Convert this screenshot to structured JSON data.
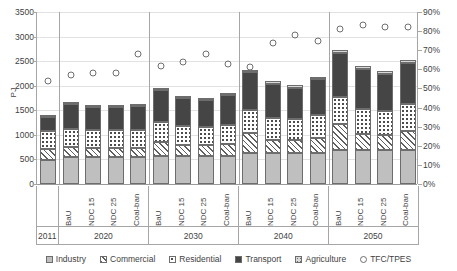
{
  "chart_data": {
    "type": "bar",
    "title": "",
    "xlabel": "",
    "ylabel": "PJ",
    "ylim": [
      0,
      3500
    ],
    "y_ticks": [
      0,
      500,
      1000,
      1500,
      2000,
      2500,
      3000,
      3500
    ],
    "secondary_ylabel": "",
    "secondary_ylim": [
      0,
      90
    ],
    "secondary_y_ticks": [
      "0%",
      "10%",
      "20%",
      "30%",
      "40%",
      "50%",
      "60%",
      "70%",
      "80%",
      "90%"
    ],
    "grid": true,
    "stacked": true,
    "legend_position": "bottom",
    "categories": [
      "2011",
      "BaU",
      "NDC 15",
      "NDC 25",
      "Coal-ban",
      "BaU",
      "NDC 15",
      "NDC 25",
      "Coal-ban",
      "BaU",
      "NDC 15",
      "NDC 25",
      "Coal-ban",
      "BaU",
      "NDC 15",
      "NDC 25",
      "Coal-ban"
    ],
    "groups": [
      {
        "label": "2011",
        "count": 1
      },
      {
        "label": "2020",
        "count": 4
      },
      {
        "label": "2030",
        "count": 4
      },
      {
        "label": "2040",
        "count": 4
      },
      {
        "label": "2050",
        "count": 4
      }
    ],
    "series": [
      {
        "name": "Industry",
        "values": [
          490,
          545,
          545,
          545,
          545,
          580,
          580,
          580,
          580,
          640,
          640,
          640,
          640,
          690,
          690,
          690,
          690
        ]
      },
      {
        "name": "Commercial",
        "values": [
          225,
          200,
          195,
          195,
          190,
          280,
          210,
          205,
          230,
          390,
          265,
          255,
          300,
          530,
          330,
          315,
          390
        ]
      },
      {
        "name": "Residential",
        "values": [
          355,
          370,
          365,
          360,
          370,
          410,
          390,
          375,
          400,
          480,
          440,
          420,
          460,
          560,
          510,
          480,
          540
        ]
      },
      {
        "name": "Transport",
        "values": [
          285,
          515,
          470,
          470,
          490,
          640,
          575,
          540,
          600,
          770,
          700,
          645,
          730,
          880,
          820,
          760,
          840
        ]
      },
      {
        "name": "Agriculture",
        "values": [
          20,
          30,
          30,
          30,
          30,
          40,
          40,
          40,
          40,
          50,
          50,
          50,
          50,
          60,
          60,
          60,
          60
        ]
      }
    ],
    "markers": {
      "name": "TFC/TPES",
      "axis": "secondary",
      "unit": "%",
      "values": [
        54,
        57,
        58,
        58,
        68,
        62,
        64,
        68,
        63,
        61,
        74,
        78,
        75,
        81,
        83,
        82,
        82
      ]
    }
  },
  "legend": {
    "items": [
      {
        "label": "Industry",
        "swatch": "solid-light-gray"
      },
      {
        "label": "Commercial",
        "swatch": "diagonal-hatch"
      },
      {
        "label": "Residential",
        "swatch": "dotted"
      },
      {
        "label": "Transport",
        "swatch": "solid-dark-gray"
      },
      {
        "label": "Agriculture",
        "swatch": "fine-dotted"
      },
      {
        "label": "TFC/TPES",
        "swatch": "open-circle"
      }
    ]
  },
  "colors": {
    "industry": "#bfbfbf",
    "commercial": "#ffffff",
    "residential": "#ffffff",
    "transport": "#454545",
    "agriculture": "#d9d9d9",
    "marker": "#6f6f6f",
    "grid": "#e2e2e2",
    "axis": "#a6a6a6",
    "text": "#3f3f3f"
  }
}
